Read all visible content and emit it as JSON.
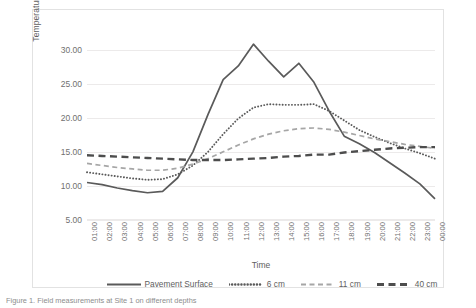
{
  "figure": {
    "caption": "Figure 1.  Field measurements at Site 1 on different depths"
  },
  "chart_data": {
    "type": "line",
    "title": "",
    "xlabel": "Time",
    "ylabel": "Temperature (C)",
    "ylim": [
      5,
      32
    ],
    "yticks": [
      5.0,
      10.0,
      15.0,
      20.0,
      25.0,
      30.0
    ],
    "ytick_labels": [
      "5.00",
      "10.00",
      "15.00",
      "20.00",
      "25.00",
      "30.00"
    ],
    "grid": "horizontal",
    "legend_position": "bottom",
    "x": [
      "01:00",
      "02:00",
      "03:00",
      "04:00",
      "05:00",
      "06:00",
      "07:00",
      "08:00",
      "09:00",
      "10:00",
      "11:00",
      "12:00",
      "13:00",
      "14:00",
      "15:00",
      "16:00",
      "17:00",
      "18:00",
      "19:00",
      "20:00",
      "21:00",
      "22:00",
      "23:00",
      "00:00"
    ],
    "series": [
      {
        "name": "Pavement Surface",
        "style": "solid",
        "color": "#5a5a5a",
        "values": [
          10.5,
          10.2,
          9.7,
          9.3,
          9.0,
          9.2,
          11.2,
          15.0,
          20.5,
          25.6,
          27.6,
          30.8,
          28.3,
          26.0,
          28.0,
          25.2,
          21.0,
          17.3,
          16.2,
          14.9,
          13.4,
          11.9,
          10.3,
          8.1
        ]
      },
      {
        "name": "6 cm",
        "style": "dotted",
        "color": "#5a5a5a",
        "values": [
          12.0,
          11.7,
          11.4,
          11.1,
          10.9,
          11.0,
          11.7,
          13.0,
          15.0,
          17.6,
          19.9,
          21.5,
          22.0,
          21.9,
          21.9,
          22.0,
          21.0,
          19.6,
          18.2,
          17.2,
          16.3,
          15.5,
          14.8,
          14.0
        ]
      },
      {
        "name": "11 cm",
        "style": "dashed",
        "color": "#a6a6a6",
        "values": [
          13.3,
          13.0,
          12.7,
          12.5,
          12.3,
          12.3,
          12.6,
          13.2,
          14.0,
          15.0,
          16.0,
          16.9,
          17.6,
          18.1,
          18.4,
          18.5,
          18.3,
          17.9,
          17.4,
          16.9,
          16.5,
          16.1,
          15.8,
          15.5
        ]
      },
      {
        "name": "40 cm",
        "style": "long-dash",
        "color": "#4d4d4d",
        "values": [
          14.5,
          14.4,
          14.3,
          14.2,
          14.1,
          14.0,
          13.9,
          13.8,
          13.8,
          13.8,
          13.9,
          14.0,
          14.1,
          14.3,
          14.4,
          14.6,
          14.6,
          14.9,
          15.1,
          15.3,
          15.5,
          15.6,
          15.7,
          15.7
        ]
      }
    ]
  }
}
